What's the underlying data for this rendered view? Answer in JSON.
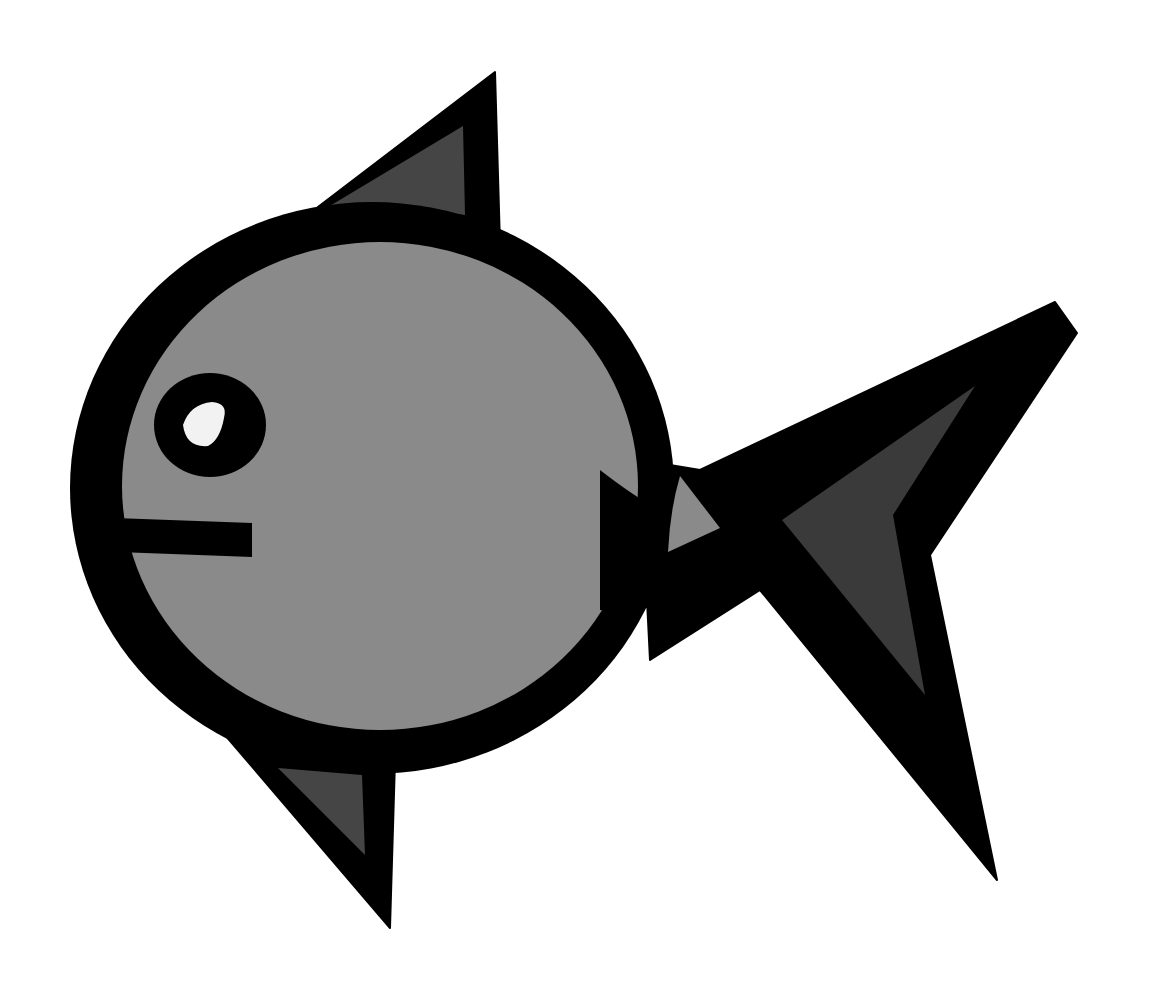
{
  "image": {
    "subject": "stylized cartoon fish",
    "background": "#ffffff",
    "colors": {
      "outline": "#000000",
      "body_fill": "#8a8a8a",
      "fin_fill": "#454545",
      "eye_highlight": "#f2f2f2"
    }
  }
}
